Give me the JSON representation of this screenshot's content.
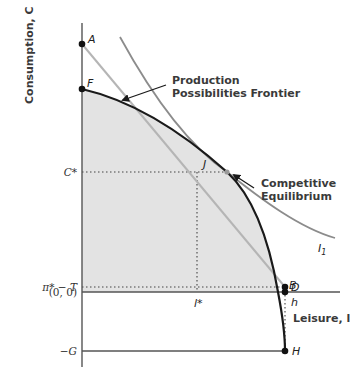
{
  "diagram": {
    "y_axis_label": "Consumption, C",
    "x_axis_label": "Leisure, l",
    "annotations": {
      "ppf": [
        "Production",
        "Possibilities Frontier"
      ],
      "equilibrium": [
        "Competitive",
        "Equilibrium"
      ]
    },
    "points": {
      "A": "A",
      "F": "F",
      "J": "J",
      "D": "D",
      "B": "B",
      "H": "H"
    },
    "y_ticks": {
      "c_star": "C*",
      "pi_minus_t": "π* − T",
      "origin": "(0, 0)",
      "neg_g": "−G"
    },
    "x_ticks": {
      "l_star": "l*",
      "h": "h"
    },
    "curve_labels": {
      "indifference": "I",
      "indifference_sub": "1"
    },
    "colors": {
      "ppf": "#1a1a1a",
      "budget_line": "#b5b5b5",
      "indifference": "#8c8c8c",
      "shaded_region": "#e3e3e3",
      "axis": "#555555"
    }
  }
}
